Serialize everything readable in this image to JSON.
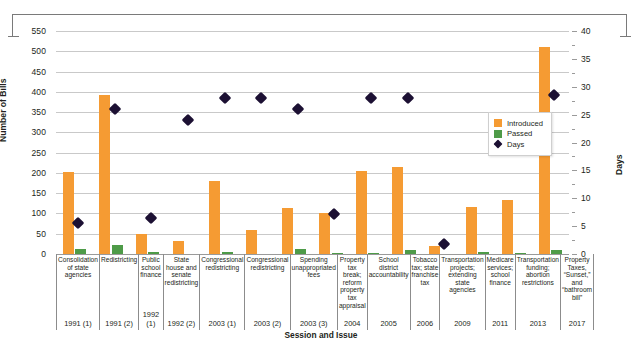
{
  "chart_data": {
    "type": "bar",
    "title": "",
    "xlabel": "Session and Issue",
    "ylabel": "Number of Bills",
    "y2label": "Days",
    "ylim": [
      0,
      550
    ],
    "y2lim": [
      0,
      40
    ],
    "y_ticks": [
      0,
      50,
      100,
      150,
      200,
      250,
      300,
      350,
      400,
      450,
      500,
      550
    ],
    "y2_ticks": [
      0,
      5,
      10,
      15,
      20,
      25,
      30,
      35,
      40
    ],
    "grid": true,
    "legend_position": "inside-right",
    "legend": [
      "Introduced",
      "Passed",
      "Days"
    ],
    "colors": {
      "introduced": "#F59B33",
      "passed": "#4E9B48",
      "days": "#1C1033",
      "gridline": "#C9C9C9",
      "axis": "#8C8C8C",
      "text": "#231F20"
    },
    "categories": [
      {
        "session": "1991 (1)",
        "issue": "Consolidation of state agencies"
      },
      {
        "session": "1991 (2)",
        "issue": "Redistricting"
      },
      {
        "session": "1992 (1)",
        "issue": "Public school finance"
      },
      {
        "session": "1992 (2)",
        "issue": "State house and senate redistricting"
      },
      {
        "session": "2003 (1)",
        "issue": "Congressional redistricting"
      },
      {
        "session": "2003 (2)",
        "issue": "Congressional redistricting"
      },
      {
        "session": "2003 (3)",
        "issue": "Spending unappropriated fees"
      },
      {
        "session": "2004",
        "issue": "Property tax break; reform property tax appraisal"
      },
      {
        "session": "2005",
        "issue": "School district accountability"
      },
      {
        "session": "2006",
        "issue": "Tobacco tax; state franchise tax"
      },
      {
        "session": "2009",
        "issue": "Transportation projects; extending state agencies"
      },
      {
        "session": "2011",
        "issue": "Medicare services; school finance"
      },
      {
        "session": "2013",
        "issue": "Transportation funding; abortion restrictions"
      },
      {
        "session": "2017",
        "issue": "Property Taxes, “Sunset,” and “bathroom bill”"
      }
    ],
    "series": [
      {
        "name": "Introduced",
        "axis": "left",
        "values": [
          203,
          392,
          50,
          33,
          181,
          60,
          114,
          101,
          205,
          214,
          20,
          117,
          132,
          511
        ]
      },
      {
        "name": "Passed",
        "axis": "left",
        "values": [
          12,
          22,
          4,
          0,
          4,
          0,
          12,
          3,
          2,
          9,
          0,
          5,
          2,
          9
        ]
      },
      {
        "name": "Days",
        "axis": "right",
        "values": [
          5.6,
          26,
          6.5,
          24,
          28,
          28,
          26,
          7.2,
          28,
          28,
          2,
          0,
          0,
          29
        ]
      }
    ],
    "days_points": [
      {
        "category_index": 0,
        "value": 5.6
      },
      {
        "category_index": 1,
        "value": 26.0
      },
      {
        "category_index": 2,
        "value": 6.5
      },
      {
        "category_index": 3,
        "value": 24.0
      },
      {
        "category_index": 4,
        "value": 28.0
      },
      {
        "category_index": 5,
        "value": 28.0
      },
      {
        "category_index": 6,
        "value": 26.0
      },
      {
        "category_index": 7,
        "value": 7.2
      },
      {
        "category_index": 8,
        "value": 28.0
      },
      {
        "category_index": 9,
        "value": 28.0
      },
      {
        "category_index": 10,
        "value": 1.8
      },
      {
        "category_index": 13,
        "value": 28.5
      }
    ]
  }
}
